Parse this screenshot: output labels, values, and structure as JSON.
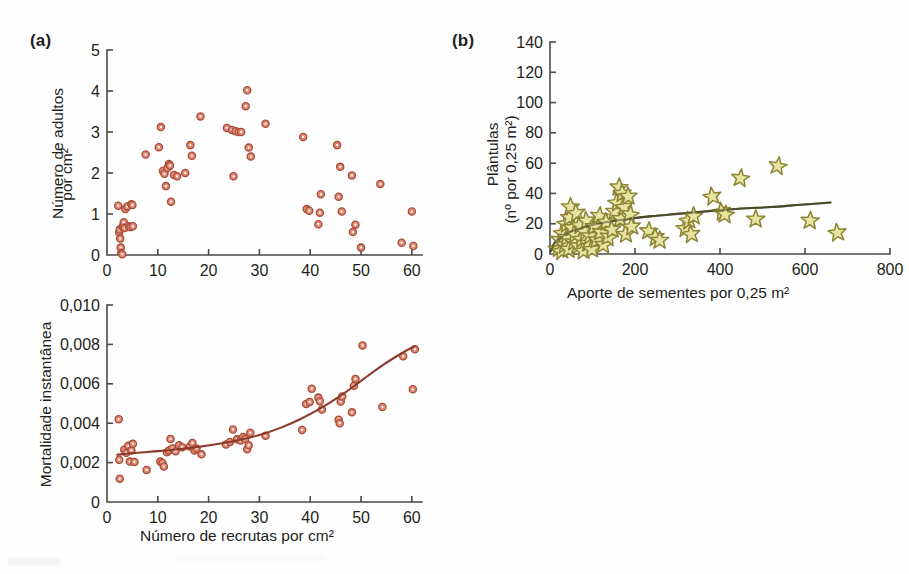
{
  "figure": {
    "background_color": "#fefefe",
    "panels": [
      {
        "tag": "(a)"
      },
      {
        "tag": "(b)"
      }
    ]
  },
  "colors": {
    "marker_circle_fill": "#e08a76",
    "marker_circle_stroke": "#a84b36",
    "marker_circle_center": "#ffffff",
    "star_fill": "#e8e3a0",
    "star_stroke": "#8d8535",
    "curve_mortality": "#8c3a2b",
    "curve_seedlings": "#4a4a2a",
    "axis": "#4a4a4a",
    "text": "#231f20"
  },
  "chart_data": [
    {
      "id": "adults-vs-recruits",
      "panel": "(a)",
      "type": "scatter",
      "title": "",
      "xlabel": "",
      "ylabel": "Número de adultos\npor cm²",
      "ylabel_lines": [
        "Número de adultos",
        "por cm²"
      ],
      "xlim": [
        0,
        62
      ],
      "ylim": [
        0,
        5
      ],
      "xticks": [
        0,
        10,
        20,
        30,
        40,
        50,
        60
      ],
      "xtick_labels": [
        "0",
        "10",
        "20",
        "30",
        "40",
        "50",
        "60"
      ],
      "yticks": [
        0,
        1,
        2,
        3,
        4,
        5
      ],
      "ytick_labels": [
        "0",
        "1",
        "2",
        "3",
        "4",
        "5"
      ],
      "grid": false,
      "legend": "none",
      "marker": "open-circle",
      "points": [
        [
          2.2,
          1.2
        ],
        [
          2.4,
          0.55
        ],
        [
          2.5,
          0.62
        ],
        [
          2.6,
          0.4
        ],
        [
          2.7,
          0.18
        ],
        [
          2.8,
          0.05
        ],
        [
          3.0,
          0.02
        ],
        [
          3.1,
          0.68
        ],
        [
          3.2,
          0.72
        ],
        [
          3.3,
          0.8
        ],
        [
          3.5,
          0.66
        ],
        [
          3.6,
          1.12
        ],
        [
          4.0,
          1.18
        ],
        [
          4.3,
          0.7
        ],
        [
          4.6,
          0.68
        ],
        [
          4.8,
          1.24
        ],
        [
          5.0,
          1.22
        ],
        [
          5.1,
          0.7
        ],
        [
          7.6,
          2.45
        ],
        [
          10.2,
          2.63
        ],
        [
          10.6,
          3.12
        ],
        [
          11.0,
          2.05
        ],
        [
          11.3,
          1.98
        ],
        [
          11.6,
          1.68
        ],
        [
          11.9,
          2.12
        ],
        [
          12.2,
          2.22
        ],
        [
          12.4,
          2.18
        ],
        [
          12.6,
          1.3
        ],
        [
          13.2,
          1.95
        ],
        [
          13.8,
          1.92
        ],
        [
          15.4,
          2.0
        ],
        [
          16.4,
          2.68
        ],
        [
          16.7,
          2.42
        ],
        [
          18.4,
          3.38
        ],
        [
          23.6,
          3.1
        ],
        [
          24.6,
          3.05
        ],
        [
          24.9,
          1.92
        ],
        [
          25.3,
          3.02
        ],
        [
          25.9,
          3.0
        ],
        [
          26.4,
          3.0
        ],
        [
          27.3,
          3.63
        ],
        [
          27.6,
          4.02
        ],
        [
          27.9,
          2.62
        ],
        [
          28.3,
          2.4
        ],
        [
          31.2,
          3.2
        ],
        [
          38.6,
          2.88
        ],
        [
          39.3,
          1.12
        ],
        [
          39.8,
          1.08
        ],
        [
          41.6,
          0.75
        ],
        [
          41.9,
          1.03
        ],
        [
          42.1,
          1.48
        ],
        [
          45.3,
          2.68
        ],
        [
          45.6,
          1.42
        ],
        [
          45.9,
          2.15
        ],
        [
          46.2,
          1.06
        ],
        [
          48.2,
          1.94
        ],
        [
          48.4,
          0.56
        ],
        [
          48.9,
          0.74
        ],
        [
          50.0,
          0.18
        ],
        [
          53.8,
          1.73
        ],
        [
          58.0,
          0.3
        ],
        [
          60.0,
          1.06
        ],
        [
          60.3,
          0.22
        ]
      ]
    },
    {
      "id": "mortality-vs-recruits",
      "panel": "(a)",
      "type": "scatter",
      "title": "",
      "xlabel": "Número de recrutas por cm²",
      "ylabel": "Mortalidade instantânea",
      "xlim": [
        0,
        62
      ],
      "ylim": [
        0,
        0.01
      ],
      "xticks": [
        0,
        10,
        20,
        30,
        40,
        50,
        60
      ],
      "xtick_labels": [
        "0",
        "10",
        "20",
        "30",
        "40",
        "50",
        "60"
      ],
      "yticks": [
        0,
        0.002,
        0.004,
        0.006,
        0.008,
        0.01
      ],
      "ytick_labels": [
        "0",
        "0,002",
        "0,004",
        "0,006",
        "0,008",
        "0,010"
      ],
      "grid": false,
      "legend": "none",
      "marker": "open-circle",
      "fit_curve": {
        "label": "",
        "color": "#8c3a2b",
        "type": "exponential",
        "points": [
          [
            2.0,
            0.0024
          ],
          [
            6.0,
            0.0025
          ],
          [
            10.0,
            0.00258
          ],
          [
            14.0,
            0.00268
          ],
          [
            18.0,
            0.0028
          ],
          [
            22.0,
            0.00296
          ],
          [
            26.0,
            0.00315
          ],
          [
            30.0,
            0.0034
          ],
          [
            34.0,
            0.00375
          ],
          [
            38.0,
            0.0042
          ],
          [
            42.0,
            0.00475
          ],
          [
            46.0,
            0.0054
          ],
          [
            50.0,
            0.00615
          ],
          [
            54.0,
            0.0069
          ],
          [
            58.0,
            0.00755
          ],
          [
            60.5,
            0.0079
          ]
        ]
      },
      "points": [
        [
          2.3,
          0.0042
        ],
        [
          2.4,
          0.00215
        ],
        [
          2.5,
          0.00118
        ],
        [
          3.4,
          0.00265
        ],
        [
          3.8,
          0.0025
        ],
        [
          4.2,
          0.00285
        ],
        [
          4.5,
          0.00205
        ],
        [
          4.8,
          0.00262
        ],
        [
          5.1,
          0.00296
        ],
        [
          5.4,
          0.00203
        ],
        [
          7.8,
          0.00163
        ],
        [
          10.5,
          0.00205
        ],
        [
          10.9,
          0.00198
        ],
        [
          11.2,
          0.0018
        ],
        [
          11.8,
          0.00252
        ],
        [
          12.2,
          0.00262
        ],
        [
          12.5,
          0.0032
        ],
        [
          12.9,
          0.00272
        ],
        [
          13.5,
          0.00258
        ],
        [
          14.2,
          0.00288
        ],
        [
          14.8,
          0.00278
        ],
        [
          16.3,
          0.00282
        ],
        [
          16.8,
          0.003
        ],
        [
          17.2,
          0.00262
        ],
        [
          17.6,
          0.00272
        ],
        [
          18.6,
          0.00242
        ],
        [
          23.4,
          0.00292
        ],
        [
          24.2,
          0.00305
        ],
        [
          24.8,
          0.00368
        ],
        [
          25.6,
          0.00318
        ],
        [
          26.3,
          0.00312
        ],
        [
          26.8,
          0.0033
        ],
        [
          27.2,
          0.0032
        ],
        [
          27.6,
          0.00268
        ],
        [
          27.9,
          0.00288
        ],
        [
          28.2,
          0.00352
        ],
        [
          31.2,
          0.00336
        ],
        [
          38.4,
          0.00366
        ],
        [
          39.2,
          0.00498
        ],
        [
          39.9,
          0.00508
        ],
        [
          40.3,
          0.00575
        ],
        [
          41.6,
          0.0053
        ],
        [
          41.9,
          0.00512
        ],
        [
          42.3,
          0.0047
        ],
        [
          45.6,
          0.00418
        ],
        [
          45.8,
          0.004
        ],
        [
          46.0,
          0.0051
        ],
        [
          46.3,
          0.00535
        ],
        [
          48.2,
          0.00455
        ],
        [
          48.6,
          0.0059
        ],
        [
          48.9,
          0.00625
        ],
        [
          50.3,
          0.00795
        ],
        [
          54.2,
          0.00482
        ],
        [
          58.3,
          0.0074
        ],
        [
          60.2,
          0.00572
        ],
        [
          60.6,
          0.00775
        ]
      ]
    },
    {
      "id": "seedlings-vs-seed-input",
      "panel": "(b)",
      "type": "scatter",
      "title": "",
      "xlabel": "Aporte de sementes por 0,25 m²",
      "ylabel": "Plântulas\n(nº por 0,25 m²)",
      "ylabel_lines": [
        "Plântulas",
        "(nº por 0,25 m²)"
      ],
      "xlim": [
        0,
        800
      ],
      "ylim": [
        0,
        140
      ],
      "xticks": [
        0,
        200,
        400,
        600,
        800
      ],
      "xtick_labels": [
        "0",
        "200",
        "400",
        "600",
        "800"
      ],
      "yticks": [
        0,
        20,
        40,
        60,
        80,
        100,
        120,
        140
      ],
      "ytick_labels": [
        "0",
        "20",
        "40",
        "60",
        "80",
        "100",
        "120",
        "140"
      ],
      "grid": false,
      "legend": "none",
      "marker": "star",
      "fit_curve": {
        "label": "",
        "color": "#4a4a2a",
        "type": "power-law",
        "points": [
          [
            2,
            2
          ],
          [
            10,
            7
          ],
          [
            20,
            10
          ],
          [
            40,
            13.5
          ],
          [
            60,
            16
          ],
          [
            90,
            18.5
          ],
          [
            130,
            21
          ],
          [
            180,
            23
          ],
          [
            240,
            25
          ],
          [
            300,
            26.5
          ],
          [
            380,
            28.5
          ],
          [
            450,
            30
          ],
          [
            520,
            31
          ],
          [
            590,
            32.5
          ],
          [
            660,
            34
          ]
        ]
      },
      "points": [
        [
          18,
          4
        ],
        [
          22,
          9
        ],
        [
          26,
          2
        ],
        [
          30,
          14
        ],
        [
          34,
          6
        ],
        [
          38,
          20
        ],
        [
          40,
          11
        ],
        [
          44,
          3
        ],
        [
          46,
          24
        ],
        [
          48,
          31
        ],
        [
          52,
          17
        ],
        [
          56,
          8
        ],
        [
          58,
          13
        ],
        [
          62,
          27
        ],
        [
          66,
          5
        ],
        [
          70,
          19
        ],
        [
          74,
          10
        ],
        [
          78,
          2
        ],
        [
          82,
          15
        ],
        [
          86,
          22
        ],
        [
          90,
          7
        ],
        [
          94,
          12
        ],
        [
          98,
          3
        ],
        [
          104,
          18
        ],
        [
          110,
          9
        ],
        [
          116,
          25
        ],
        [
          120,
          14
        ],
        [
          126,
          6
        ],
        [
          132,
          21
        ],
        [
          138,
          11
        ],
        [
          146,
          16
        ],
        [
          152,
          28
        ],
        [
          158,
          34
        ],
        [
          162,
          44
        ],
        [
          166,
          23
        ],
        [
          170,
          40
        ],
        [
          174,
          31
        ],
        [
          178,
          13
        ],
        [
          184,
          38
        ],
        [
          188,
          26
        ],
        [
          192,
          18
        ],
        [
          232,
          15
        ],
        [
          248,
          11
        ],
        [
          258,
          9
        ],
        [
          318,
          17
        ],
        [
          326,
          22
        ],
        [
          332,
          13
        ],
        [
          338,
          25
        ],
        [
          382,
          38
        ],
        [
          404,
          28
        ],
        [
          412,
          26
        ],
        [
          448,
          50
        ],
        [
          484,
          23
        ],
        [
          536,
          58
        ],
        [
          612,
          22
        ],
        [
          676,
          14
        ]
      ]
    }
  ]
}
